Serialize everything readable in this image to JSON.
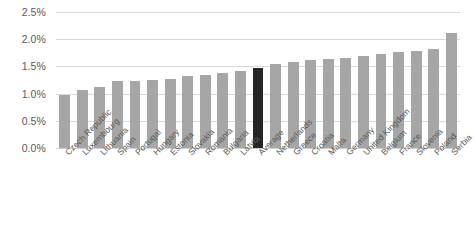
{
  "chart_data": {
    "type": "bar",
    "title": "",
    "xlabel": "",
    "ylabel": "",
    "ylim": [
      0,
      0.025
    ],
    "grid": true,
    "legend": "none",
    "y_ticks": [
      "0.0%",
      "0.5%",
      "1.0%",
      "1.5%",
      "2.0%",
      "2.5%"
    ],
    "y_tick_values": [
      0.0,
      0.005,
      0.01,
      0.015,
      0.02,
      0.025
    ],
    "categories": [
      "Czech Republic",
      "Luxembourg",
      "Lithuania",
      "Spain",
      "Portugal",
      "Hungary",
      "Estonia",
      "Slovakia",
      "Romania",
      "Bulgaria",
      "Latvia",
      "Average",
      "Netherlands",
      "Greece",
      "Croatia",
      "Malta",
      "Germany",
      "United Kingdom",
      "Belgium",
      "France",
      "Slovenia",
      "Poland",
      "Serbia"
    ],
    "values": [
      0.97,
      1.07,
      1.13,
      1.23,
      1.24,
      1.25,
      1.26,
      1.33,
      1.35,
      1.38,
      1.41,
      1.48,
      1.55,
      1.58,
      1.61,
      1.64,
      1.65,
      1.7,
      1.73,
      1.76,
      1.78,
      1.82,
      2.12
    ],
    "value_unit": "%",
    "highlight_category": "Average",
    "colors": {
      "bar": "#a6a6a6",
      "highlight_bar": "#262626",
      "gridline": "#d9d9d9",
      "tick_text": "#595959",
      "background": "#ffffff"
    }
  }
}
